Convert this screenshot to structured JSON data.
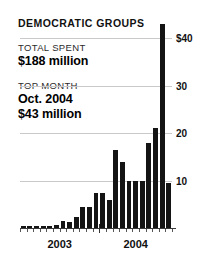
{
  "header": {
    "title": "DEMOCRATIC GROUPS",
    "total_spent_label": "TOTAL SPENT",
    "total_spent_value": "$188 million",
    "top_month_label": "TOP MONTH",
    "top_month_value": "Oct. 2004",
    "top_month_amount": "$43 million"
  },
  "chart_data": {
    "type": "bar",
    "title": "DEMOCRATIC GROUPS",
    "xlabel": "",
    "ylabel": "",
    "ylim": [
      0,
      45
    ],
    "grid": true,
    "legend": false,
    "bar_color": "#141414",
    "gridline_color": "#c9c9c9",
    "ytick_labels": [
      "$40",
      "30",
      "20",
      "10"
    ],
    "ytick_values": [
      40,
      30,
      20,
      10
    ],
    "xtick_labels": [
      "2003",
      "2004"
    ],
    "categories": [
      "Jan 2003",
      "Feb 2003",
      "Mar 2003",
      "Apr 2003",
      "May 2003",
      "Jun 2003",
      "Jul 2003",
      "Aug 2003",
      "Sep 2003",
      "Oct 2003",
      "Nov 2003",
      "Dec 2003",
      "Jan 2004",
      "Feb 2004",
      "Mar 2004",
      "Apr 2004",
      "May 2004",
      "Jun 2004",
      "Jul 2004",
      "Aug 2004",
      "Sep 2004",
      "Oct 2004",
      "Nov 2004"
    ],
    "values": [
      0.4,
      0.4,
      0.4,
      0.5,
      0.5,
      0.6,
      1.4,
      1.3,
      2.4,
      4.5,
      4.5,
      7.3,
      7.3,
      5.8,
      16.5,
      14.0,
      10.0,
      9.8,
      10.0,
      18.0,
      21.0,
      43.0,
      9.5
    ],
    "annotations": [
      {
        "label": "TOTAL SPENT",
        "value": "$188 million"
      },
      {
        "label": "TOP MONTH",
        "value": "Oct. 2004",
        "amount": "$43 million"
      }
    ]
  }
}
